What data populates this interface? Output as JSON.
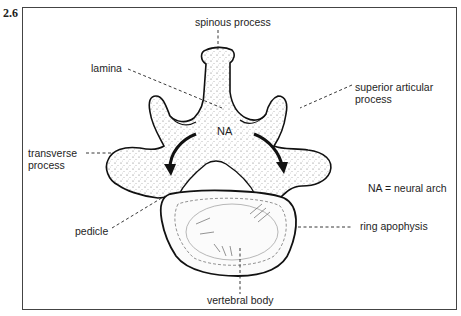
{
  "figure": {
    "number": "2.6",
    "legend": "NA = neural arch",
    "arch_abbrev": "NA"
  },
  "labels": {
    "spinous_process": "spinous process",
    "lamina": "lamina",
    "superior_articular_line1": "superior articular",
    "superior_articular_line2": "process",
    "transverse_line1": "transverse",
    "transverse_line2": "process",
    "pedicle": "pedicle",
    "ring_apophysis": "ring apophysis",
    "vertebral_body": "vertebral body"
  },
  "colors": {
    "ink": "#1a1a1a",
    "frame": "#444444",
    "background": "#ffffff"
  }
}
